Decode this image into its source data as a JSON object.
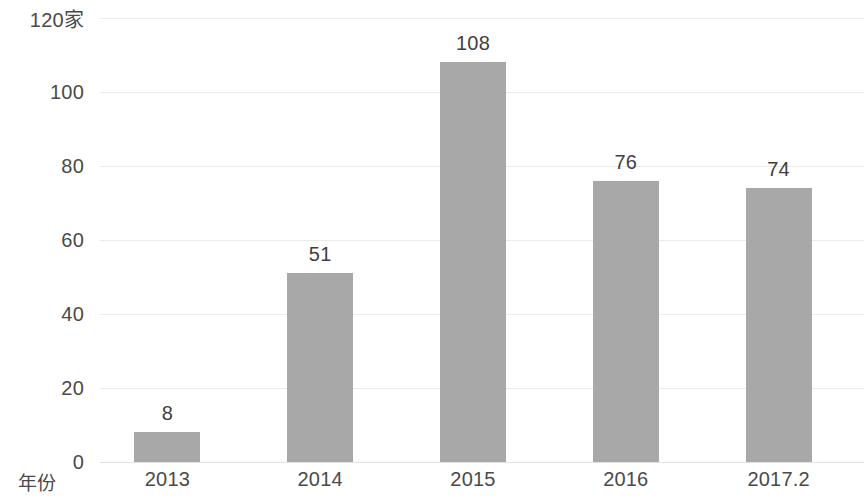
{
  "chart_data": {
    "type": "bar",
    "title": "",
    "subtitle": "",
    "xlabel": "年份",
    "ylabel": "",
    "y_unit_label": "120家",
    "categories": [
      "2013",
      "2014",
      "2015",
      "2016",
      "2017.2"
    ],
    "values": [
      8,
      51,
      108,
      76,
      74
    ],
    "value_labels": [
      "8",
      "51",
      "108",
      "76",
      "74"
    ],
    "ylim": [
      0,
      120
    ],
    "yticks": [
      0,
      20,
      40,
      60,
      80,
      100,
      120
    ],
    "ytick_labels": [
      "0",
      "20",
      "40",
      "60",
      "80",
      "100",
      "120"
    ],
    "grid": true,
    "grid_axis": "y",
    "legend": false,
    "legend_position": "none",
    "series": [
      {
        "name": "",
        "values": [
          8,
          51,
          108,
          76,
          74
        ],
        "color": "#a8a8a8"
      }
    ]
  },
  "colors": {
    "bar_fill": "#a8a8a8",
    "gridline": "#ebebeb",
    "baseline": "#e2e2e2",
    "tick_text": "#4a4a4a",
    "value_text": "#3f3f3f",
    "background": "#ffffff"
  }
}
